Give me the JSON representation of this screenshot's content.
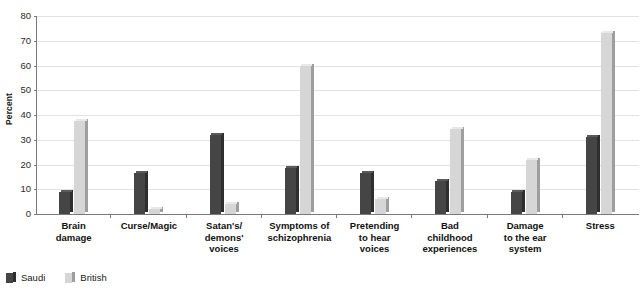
{
  "chart_data": {
    "type": "bar",
    "title": "",
    "xlabel": "",
    "ylabel": "Percent",
    "ylim": [
      0,
      80
    ],
    "yticks": [
      0,
      10,
      20,
      30,
      40,
      50,
      60,
      70,
      80
    ],
    "grid": true,
    "legend_position": "bottom-left",
    "categories": [
      "Brain\ndamage",
      "Curse/Magic",
      "Satan's/\ndemons'\nvoices",
      "Symptoms of\nschizophrenia",
      "Pretending\nto hear\nvoices",
      "Bad\nchildhood\nexperiences",
      "Damage\nto the ear\nsystem",
      "Stress"
    ],
    "series": [
      {
        "name": "Saudi",
        "color": "#454545",
        "values": [
          9,
          16.5,
          32,
          18.5,
          16.5,
          13.5,
          9,
          31
        ]
      },
      {
        "name": "British",
        "color": "#d6d6d6",
        "values": [
          37.5,
          2,
          4,
          60,
          6,
          34.5,
          22,
          73
        ]
      }
    ]
  },
  "legend": {
    "items": [
      {
        "label": "Saudi"
      },
      {
        "label": "British"
      }
    ]
  }
}
